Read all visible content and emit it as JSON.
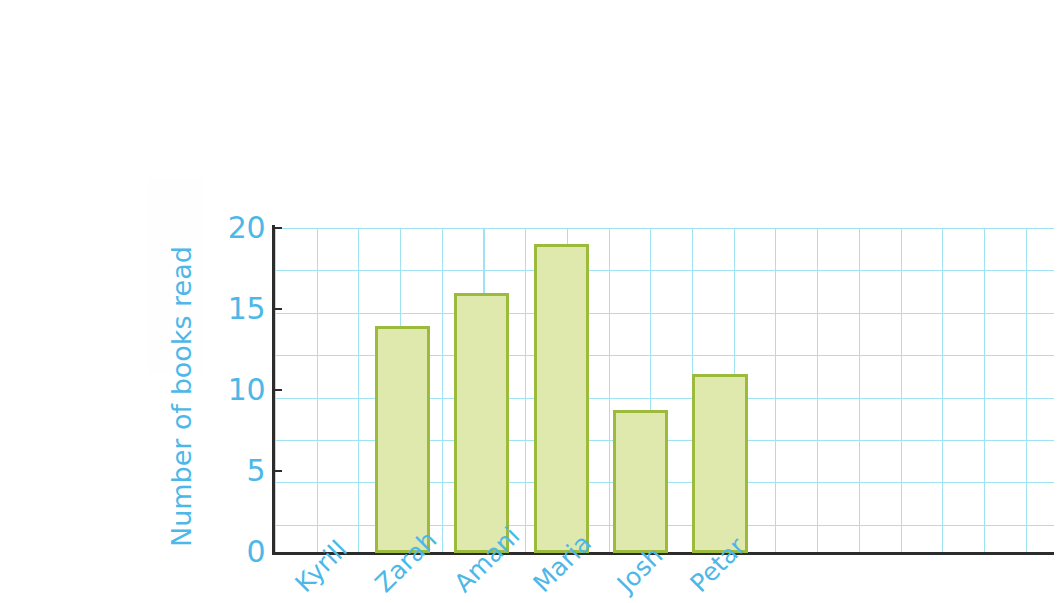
{
  "chart_data": {
    "type": "bar",
    "title": "",
    "xlabel": "",
    "ylabel": "Number of books read",
    "categories": [
      "Kyrill",
      "Zarah",
      "Amani",
      "Maria",
      "Josh",
      "Petar"
    ],
    "values": [
      12,
      14,
      16,
      19,
      8.8,
      11
    ],
    "ylim": [
      0,
      20
    ],
    "y_ticks": [
      0,
      5,
      10,
      15,
      20
    ],
    "y_tick_labels": [
      "0",
      "5",
      "10",
      "15",
      "20"
    ],
    "grid": true,
    "legend": "none",
    "colors": {
      "bar_fill": "#dfe8ad",
      "bar_border": "#9cba3c",
      "grid": "#9fe3f2",
      "axis": "#2c2c2c",
      "text": "#4cb8e8",
      "background": "#fefefe"
    }
  },
  "axis": {
    "y_title": "Number of books read",
    "tick_0": "0",
    "tick_5": "5",
    "tick_10": "10",
    "tick_15": "15",
    "tick_20": "20"
  },
  "bars": [
    {
      "label": "Kyrill",
      "value": 12
    },
    {
      "label": "Zarah",
      "value": 14
    },
    {
      "label": "Amani",
      "value": 16
    },
    {
      "label": "Maria",
      "value": 19
    },
    {
      "label": "Josh",
      "value": 8.8
    },
    {
      "label": "Petar",
      "value": 11
    }
  ]
}
